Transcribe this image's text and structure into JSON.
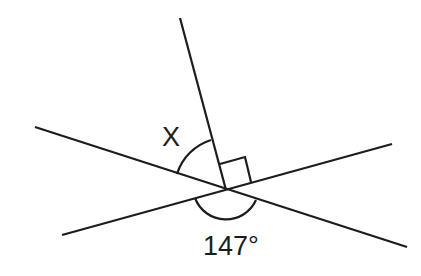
{
  "diagram": {
    "type": "geometry-angles",
    "labels": {
      "unknown_angle": "X",
      "known_angle": "147°"
    },
    "right_angle_marker": true,
    "stroke_color": "#1c1c1c",
    "background": "#ffffff"
  }
}
